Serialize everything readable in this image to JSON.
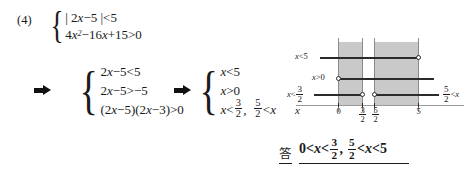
{
  "problem": {
    "number": "(4)"
  },
  "system1": {
    "rows": [
      {
        "parts": [
          "|",
          "2",
          "x",
          "−5",
          "|",
          "<",
          "5"
        ]
      },
      {
        "parts": [
          "4",
          "x",
          "²",
          "−16",
          "x",
          "+15",
          ">",
          "0"
        ]
      }
    ],
    "line1_text": "| 2x−5 |<5",
    "line2_text": "4x²−16x+15>0"
  },
  "system2": {
    "line1_text": "2x−5<5",
    "line2_text": "2x−5>−5",
    "line3_text": "(2x−5)(2x−3)>0"
  },
  "system3": {
    "line1_text": "x<5",
    "line2_text": "x>0",
    "line3_text": "x<3/2,  5/2<x",
    "line3_left_num": "3",
    "line3_left_den": "2",
    "line3_right_num": "5",
    "line3_right_den": "2"
  },
  "arrows": {
    "arrow1": "right-arrow",
    "arrow2": "right-arrow"
  },
  "diagram": {
    "labels": {
      "x_lt_5": "x<5",
      "x_gt_0": "x>0",
      "x_lt_three_halves_num": "3",
      "x_lt_three_halves_den": "2",
      "five_halves_lt_x_num": "5",
      "five_halves_lt_x_den": "2"
    },
    "axis_variable": "x",
    "ticks": [
      {
        "label": "0",
        "num": null,
        "den": null
      },
      {
        "label": null,
        "num": "3",
        "den": "2"
      },
      {
        "label": null,
        "num": "5",
        "den": "2"
      },
      {
        "label": "5",
        "num": null,
        "den": null
      }
    ],
    "shade_color": "#c9c9c9"
  },
  "answer": {
    "kanji": "答",
    "lead": "0<",
    "var1": "x",
    "mid1": "<",
    "frac1_num": "3",
    "frac1_den": "2",
    "comma": ",",
    "frac2_num": "5",
    "frac2_den": "2",
    "mid2": "<",
    "var2": "x",
    "tail": "<5"
  }
}
